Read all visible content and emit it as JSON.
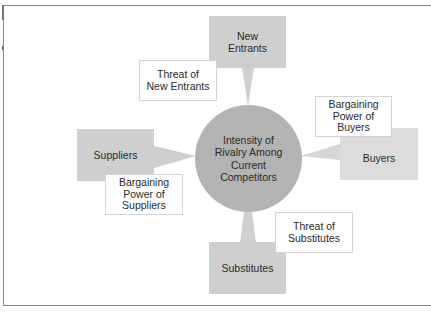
{
  "diagram": {
    "center": {
      "label": "Intensity of\nRivalry Among\nCurrent\nCompetitors"
    },
    "forces": {
      "new_entrants": {
        "label": "New\nEntrants",
        "relation": "Threat of\nNew Entrants"
      },
      "suppliers": {
        "label": "Suppliers",
        "relation": "Bargaining\nPower of\nSuppliers"
      },
      "buyers": {
        "label": "Buyers",
        "relation": "Bargaining\nPower of\nBuyers"
      },
      "substitutes": {
        "label": "Substitutes",
        "relation": "Threat of\nSubstitutes"
      }
    },
    "colors": {
      "force_box": "#cfcfcf",
      "buyers_box": "#dcdcdc",
      "circle": "#b3b3b3",
      "label_border": "#d4d4d4",
      "frame": "#8a8a8a"
    }
  }
}
